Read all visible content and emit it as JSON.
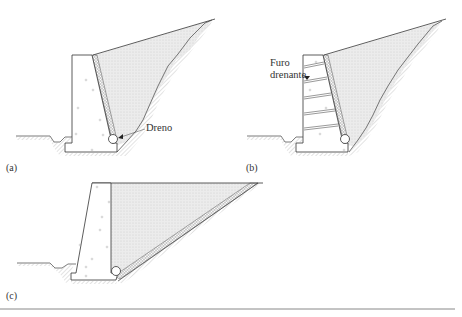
{
  "figure": {
    "panels": [
      {
        "id": "a",
        "label": "(a)",
        "callout": "Dreno"
      },
      {
        "id": "b",
        "label": "(b)",
        "callout_line1": "Furo",
        "callout_line2": "drenante"
      },
      {
        "id": "c",
        "label": "(c)"
      }
    ],
    "colors": {
      "line": "#333333",
      "backfill": "#e9e9e9",
      "gravel": "#bdbdbd",
      "ground_hatch": "#9a9a9a",
      "rule": "#888888"
    }
  }
}
